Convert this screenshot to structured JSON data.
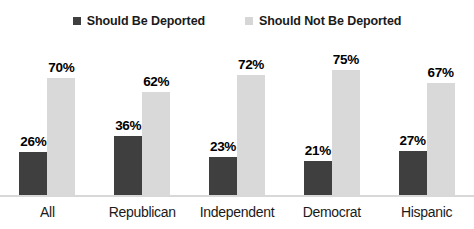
{
  "chart_data": {
    "type": "bar",
    "title": "",
    "subtitle": "",
    "xlabel": "",
    "ylabel": "",
    "ylim": [
      0,
      80
    ],
    "grid": false,
    "legend_position": "top-center",
    "value_suffix": "%",
    "categories": [
      "All",
      "Republican",
      "Independent",
      "Democrat",
      "Hispanic"
    ],
    "series": [
      {
        "name": "Should Be Deported",
        "color": "#3f3f3f",
        "values": [
          26,
          36,
          23,
          21,
          27
        ],
        "labels": [
          "26%",
          "36%",
          "23%",
          "21%",
          "27%"
        ]
      },
      {
        "name": "Should Not Be Deported",
        "color": "#d9d9d9",
        "values": [
          70,
          62,
          72,
          75,
          67
        ],
        "labels": [
          "70%",
          "62%",
          "72%",
          "75%",
          "67%"
        ]
      }
    ]
  },
  "legend": {
    "items": [
      {
        "label": "Should Be Deported",
        "swatch": "legend-swatch-dark"
      },
      {
        "label": "Should Not Be Deported",
        "swatch": "legend-swatch-light"
      }
    ]
  },
  "axis": {
    "baseline_color": "#d8d8d8"
  }
}
